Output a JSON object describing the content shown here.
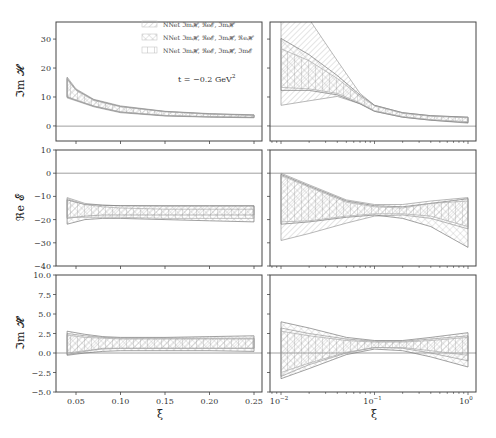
{
  "chart_data": [
    {
      "type": "area",
      "panel": "top-left",
      "ylabel": "Im H",
      "xlabel": "",
      "xscale": "linear",
      "xlim": [
        0.03,
        0.26
      ],
      "ylim": [
        -5,
        35
      ],
      "xticks": [
        "0.05",
        "0.10",
        "0.15",
        "0.20",
        "0.25"
      ],
      "yticks": [
        "0",
        "10",
        "20",
        "30"
      ],
      "annotation": "t = −0.2 GeV²",
      "legend": [
        "NNet ImH, ReE, ImH̃",
        "NNet ImH, ReE, ImH̃, ReH",
        "NNet ImH, ReE, ImH̃, ImE"
      ],
      "x": [
        0.04,
        0.05,
        0.07,
        0.1,
        0.15,
        0.2,
        0.25
      ],
      "series": [
        {
          "name": "NNet ImH, ReE, ImH̃",
          "lower": [
            9.5,
            8.5,
            6.5,
            4.5,
            3.4,
            3.0,
            2.8
          ],
          "upper": [
            16.5,
            12.5,
            9.0,
            6.8,
            5.0,
            4.2,
            3.8
          ]
        },
        {
          "name": "NNet ImH, ReE, ImH̃, ReH",
          "lower": [
            9.8,
            8.7,
            6.7,
            4.7,
            3.5,
            3.1,
            2.9
          ],
          "upper": [
            16.0,
            12.2,
            8.8,
            6.6,
            4.9,
            4.1,
            3.7
          ]
        },
        {
          "name": "NNet ImH, ReE, ImH̃, ImE",
          "lower": [
            10.0,
            8.8,
            6.8,
            4.8,
            3.6,
            3.2,
            3.0
          ],
          "upper": [
            15.8,
            12.0,
            8.6,
            6.5,
            4.8,
            4.0,
            3.6
          ]
        }
      ]
    },
    {
      "type": "area",
      "panel": "top-right",
      "ylabel": "",
      "xscale": "log",
      "xlim": [
        0.0075,
        1.2
      ],
      "ylim": [
        -5,
        35
      ],
      "xticks": [
        "10^-2",
        "10^-1",
        "10^0"
      ],
      "x": [
        0.01,
        0.02,
        0.04,
        0.07,
        0.1,
        0.2,
        0.4,
        1.0
      ],
      "series": [
        {
          "name": "NNet ImH, ReE, ImH̃",
          "lower": [
            7.0,
            8.5,
            10.0,
            7.5,
            5.0,
            3.0,
            2.0,
            1.0
          ],
          "upper": [
            36,
            36,
            22.0,
            11.0,
            7.0,
            4.5,
            3.5,
            3.0
          ]
        },
        {
          "name": "NNet ImH, ReE, ImH̃, ReH",
          "lower": [
            12.0,
            12.0,
            10.5,
            7.5,
            5.0,
            3.0,
            2.0,
            1.2
          ],
          "upper": [
            29.5,
            24.0,
            17.0,
            10.5,
            7.0,
            4.5,
            3.5,
            3.0
          ]
        },
        {
          "name": "NNet ImH, ReE, ImH̃, ImE",
          "lower": [
            13.0,
            12.5,
            11.0,
            7.8,
            5.2,
            3.2,
            2.2,
            1.5
          ],
          "upper": [
            26.0,
            22.0,
            16.0,
            10.0,
            6.8,
            4.3,
            3.3,
            2.8
          ]
        }
      ]
    },
    {
      "type": "area",
      "panel": "middle-left",
      "ylabel": "Re E",
      "xscale": "linear",
      "xlim": [
        0.03,
        0.26
      ],
      "ylim": [
        -40,
        10
      ],
      "yticks": [
        "10",
        "0",
        "−10",
        "−20",
        "−30",
        "−40"
      ],
      "x": [
        0.04,
        0.06,
        0.08,
        0.1,
        0.15,
        0.2,
        0.25
      ],
      "series": [
        {
          "name": "NNet ImH, ReE, ImH̃",
          "lower": [
            -19.5,
            -18.5,
            -18.0,
            -18.0,
            -18.0,
            -18.0,
            -18.0
          ],
          "upper": [
            -10.5,
            -13.0,
            -13.8,
            -14.0,
            -14.2,
            -14.2,
            -14.2
          ]
        },
        {
          "name": "NNet ImH, ReE, ImH̃, ReH",
          "lower": [
            -22.0,
            -20.0,
            -19.5,
            -19.5,
            -20.0,
            -20.5,
            -21.0
          ],
          "upper": [
            -11.5,
            -13.5,
            -13.8,
            -14.0,
            -14.0,
            -14.0,
            -14.0
          ]
        },
        {
          "name": "NNet ImH, ReE, ImH̃, ImE",
          "lower": [
            -19.0,
            -19.0,
            -19.0,
            -19.0,
            -19.5,
            -19.5,
            -19.5
          ],
          "upper": [
            -11.0,
            -13.5,
            -14.5,
            -15.0,
            -15.5,
            -15.5,
            -15.5
          ]
        }
      ]
    },
    {
      "type": "area",
      "panel": "middle-right",
      "ylabel": "",
      "xscale": "log",
      "xlim": [
        0.0075,
        1.2
      ],
      "ylim": [
        -40,
        10
      ],
      "x": [
        0.01,
        0.02,
        0.05,
        0.1,
        0.2,
        0.4,
        1.0
      ],
      "series": [
        {
          "name": "NNet ImH, ReE, ImH̃",
          "lower": [
            -29.0,
            -26.0,
            -21.5,
            -18.5,
            -18.0,
            -19.5,
            -24.0
          ],
          "upper": [
            0.0,
            -5.0,
            -11.5,
            -13.5,
            -13.5,
            -12.0,
            -10.5
          ]
        },
        {
          "name": "NNet ImH, ReE, ImH̃, ReH",
          "lower": [
            -22.0,
            -21.0,
            -19.0,
            -18.0,
            -19.5,
            -23.0,
            -32.0
          ],
          "upper": [
            -0.5,
            -5.5,
            -12.0,
            -14.0,
            -14.5,
            -13.0,
            -11.0
          ]
        },
        {
          "name": "NNet ImH, ReE, ImH̃, ImE",
          "lower": [
            -21.0,
            -20.5,
            -18.5,
            -17.5,
            -17.5,
            -18.5,
            -23.0
          ],
          "upper": [
            -1.0,
            -6.0,
            -12.5,
            -14.5,
            -15.0,
            -13.0,
            -12.0
          ]
        }
      ]
    },
    {
      "type": "area",
      "panel": "bottom-left",
      "ylabel": "Im H̃",
      "xlabel": "ξ",
      "xscale": "linear",
      "xlim": [
        0.03,
        0.26
      ],
      "ylim": [
        -5,
        10
      ],
      "xticks": [
        "0.05",
        "0.10",
        "0.15",
        "0.20",
        "0.25"
      ],
      "yticks": [
        "10.0",
        "7.5",
        "5.0",
        "2.5",
        "0.0",
        "−2.5",
        "−5.0"
      ],
      "x": [
        0.04,
        0.06,
        0.08,
        0.1,
        0.15,
        0.2,
        0.25
      ],
      "series": [
        {
          "name": "NNet ImH, ReE, ImH̃",
          "lower": [
            -0.2,
            0.2,
            0.6,
            0.6,
            0.6,
            0.6,
            0.6
          ],
          "upper": [
            2.5,
            2.2,
            2.0,
            1.9,
            1.9,
            1.9,
            1.9
          ]
        },
        {
          "name": "NNet ImH, ReE, ImH̃, ReH",
          "lower": [
            -0.3,
            0.0,
            0.2,
            0.3,
            0.3,
            0.3,
            0.2
          ],
          "upper": [
            2.8,
            2.4,
            2.1,
            2.0,
            2.0,
            2.1,
            2.2
          ]
        },
        {
          "name": "NNet ImH, ReE, ImH̃, ImE",
          "lower": [
            0.0,
            0.3,
            0.5,
            0.6,
            0.6,
            0.6,
            0.6
          ],
          "upper": [
            2.3,
            2.0,
            1.9,
            1.8,
            1.8,
            1.8,
            1.8
          ]
        }
      ]
    },
    {
      "type": "area",
      "panel": "bottom-right",
      "ylabel": "",
      "xlabel": "ξ",
      "xscale": "log",
      "xlim": [
        0.0075,
        1.2
      ],
      "ylim": [
        -5,
        10
      ],
      "xticks": [
        "10^-2",
        "10^-1",
        "10^0"
      ],
      "x": [
        0.01,
        0.02,
        0.05,
        0.1,
        0.2,
        0.4,
        1.0
      ],
      "series": [
        {
          "name": "NNet ImH, ReE, ImH̃",
          "lower": [
            -3.0,
            -1.5,
            0.0,
            0.7,
            0.6,
            0.0,
            -1.0
          ],
          "upper": [
            3.2,
            2.5,
            1.8,
            1.5,
            1.5,
            1.8,
            2.2
          ]
        },
        {
          "name": "NNet ImH, ReE, ImH̃, ReH",
          "lower": [
            -3.3,
            -2.0,
            -0.2,
            0.5,
            0.3,
            -0.5,
            -1.8
          ],
          "upper": [
            4.0,
            3.2,
            2.0,
            1.6,
            1.6,
            2.0,
            2.6
          ]
        },
        {
          "name": "NNet ImH, ReE, ImH̃, ImE",
          "lower": [
            -2.5,
            -1.3,
            0.1,
            0.7,
            0.7,
            0.3,
            -0.3
          ],
          "upper": [
            2.8,
            2.2,
            1.6,
            1.4,
            1.4,
            1.6,
            2.0
          ]
        }
      ]
    }
  ],
  "labels": {
    "ylabel_top": "ℑm 𝓗",
    "ylabel_mid": "ℜe 𝓔",
    "ylabel_bot": "ℑm 𝓗̃",
    "xlabel": "ξ",
    "annotation": "t = −0.2 GeV",
    "annotation_sup": "2",
    "legend": [
      "NNet ℑm𝓗, ℜe𝓔, ℑm𝓗̃",
      "NNet ℑm𝓗, ℜe𝓔, ℑm𝓗̃, ℜe𝓗",
      "NNet ℑm𝓗, ℜe𝓔, ℑm𝓗̃, ℑm𝓔"
    ],
    "yticks_top": [
      "30",
      "20",
      "10",
      "0"
    ],
    "yticks_mid": [
      "10",
      "0",
      "−10",
      "−20",
      "−30",
      "−40"
    ],
    "yticks_bot": [
      "10.0",
      "7.5",
      "5.0",
      "2.5",
      "0.0",
      "−2.5",
      "−5.0"
    ],
    "xticks_left": [
      "0.05",
      "0.10",
      "0.15",
      "0.20",
      "0.25"
    ],
    "xticks_right_base": [
      "10",
      "10",
      "10"
    ],
    "xticks_right_exp": [
      "−2",
      "−1",
      "0"
    ]
  }
}
